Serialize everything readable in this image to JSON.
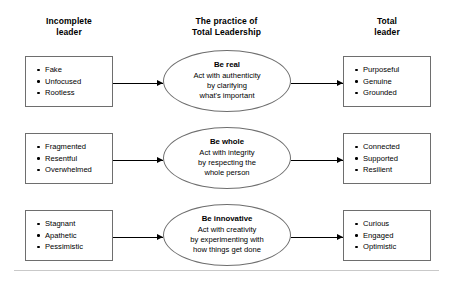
{
  "headers": {
    "left": "Incomplete\nleader",
    "center": "The practice of\nTotal Leadership",
    "right": "Total\nleader"
  },
  "rows": [
    {
      "left_items": [
        "Fake",
        "Unfocused",
        "Rootless"
      ],
      "practice_title": "Be real",
      "practice_body": "Act with authenticity\nby clarifying\nwhat's important",
      "right_items": [
        "Purposeful",
        "Genuine",
        "Grounded"
      ]
    },
    {
      "left_items": [
        "Fragmented",
        "Resentful",
        "Overwhelmed"
      ],
      "practice_title": "Be whole",
      "practice_body": "Act with integrity\nby respecting the\nwhole person",
      "right_items": [
        "Connected",
        "Supported",
        "Resilient"
      ]
    },
    {
      "left_items": [
        "Stagnant",
        "Apathetic",
        "Pessimistic"
      ],
      "practice_title": "Be innovative",
      "practice_body": "Act with creativity\nby experimenting with\nhow things get done",
      "right_items": [
        "Curious",
        "Engaged",
        "Optimistic"
      ]
    }
  ],
  "colors": {
    "text": "#000000",
    "shape_border": "#6e6e6e",
    "arrow": "#000000",
    "rule": "#c9c9c9",
    "background": "#ffffff"
  }
}
